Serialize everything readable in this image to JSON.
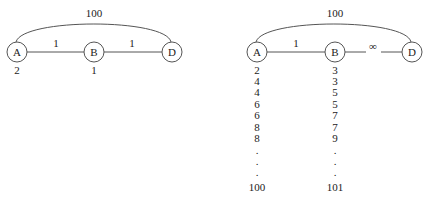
{
  "graphs": [
    {
      "name": "left",
      "arc_label": "100",
      "nodes": [
        {
          "id": "A",
          "label": "A",
          "cx": 17,
          "value": "2"
        },
        {
          "id": "B",
          "label": "B",
          "cx": 94,
          "value": "1"
        },
        {
          "id": "D",
          "label": "D",
          "cx": 172,
          "value": ""
        }
      ],
      "edges": [
        {
          "from": "A",
          "to": "B",
          "label": "1"
        },
        {
          "from": "B",
          "to": "D",
          "label": "1"
        }
      ]
    },
    {
      "name": "right",
      "arc_label": "100",
      "nodes": [
        {
          "id": "A",
          "label": "A",
          "cx": 257
        },
        {
          "id": "B",
          "label": "B",
          "cx": 335
        },
        {
          "id": "D",
          "label": "D",
          "cx": 412
        }
      ],
      "edges": [
        {
          "from": "A",
          "to": "B",
          "label": "1"
        },
        {
          "from": "B",
          "to": "D",
          "label": "∞"
        }
      ],
      "columns": {
        "A": [
          "2",
          "4",
          "4",
          "6",
          "6",
          "8",
          "8",
          ".",
          ".",
          ".",
          "100"
        ],
        "B": [
          "3",
          "3",
          "5",
          "5",
          "7",
          "7",
          "9",
          ".",
          ".",
          ".",
          "101"
        ]
      }
    }
  ]
}
